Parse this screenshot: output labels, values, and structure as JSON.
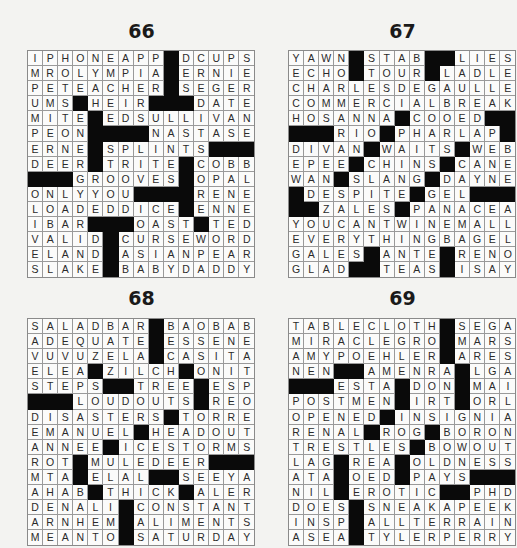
{
  "puzzles": [
    {
      "number": "66",
      "rows": [
        "IPHONEAPP#DCUPS",
        "MROLYMPIA#ERNIE",
        "PETEACHER#SEGER",
        "UMS#HEIR###DATE",
        "MITE#EDSULLIVAN",
        "PEON####NASTASE",
        "ERNE#SPLINTS###",
        "DEER#TRITE#COBB",
        "###GROOVES#OPAL",
        "ONLYYOU####RENE",
        "LOADEDDICE#ENNE",
        "IBAR###OAST#TED",
        "VALID#CURSEWORD",
        "ELAND#ASIANPEAR",
        "SLAKE#BABYDADDY"
      ]
    },
    {
      "number": "67",
      "rows": [
        "YAWN#STAB##LIES",
        "ECHO#TOUR#LADLE",
        "CHARLESDEGAULLE",
        "COMMERCIALBREAK",
        "HOSANNA#COOED##",
        "###RIO#PHARLAP#",
        "DIVAN#WAITS#WEB",
        "EPEE#CHINS#CANE",
        "WAN#SLANG#DAYNE",
        "#DESPITE#GEL###",
        "##ZALES#PANACEA",
        "YOUCANTWINEMALL",
        "EVERYTHINGBAGEL",
        "GALES#ANTE#RENO",
        "GLAD##TEAS#ISAY"
      ]
    },
    {
      "number": "68",
      "rows": [
        "SALADBAR#BAOBAB",
        "ADEQUATE#ESSENE",
        "VUVUZELA#CASITA",
        "ELEA#ZILCH#ONIT",
        "STEPS##TREE#ESP",
        "###LOUDOUTS#REO",
        "DISASTERS#TORRE",
        "EMANUEL#HEADOUT",
        "ANNEE#ICESTORMS",
        "ROT#MULEDEER###",
        "MTA#ELAL##SEEYA",
        "AHAB#THICK#ALER",
        "DENALI#CONSTANT",
        "ARNHEM#ALIMENTS",
        "MEANTO#SATURDAY"
      ]
    },
    {
      "number": "69",
      "rows": [
        "TABLECLOTH#SEGA",
        "MIRACLEGRO#MARS",
        "AMYPOEHLER#ARES",
        "NEN##AMENRA#LGA",
        "###ESTA#DON#MAI",
        "POSTMEN#IRT#ORL",
        "OPENED#INSIGNIA",
        "RENAL#ROG#BORON",
        "TRESTLES#BOWOUT",
        "LAG#REA#OLDNESS",
        "ATA#OED#PAYS###",
        "NIL#EROTIC##PHD",
        "DOES#SNEAKAPEEK",
        "INSP#ALLTERRAIN",
        "ASEA#TYLERPERRY"
      ]
    }
  ],
  "colors": {
    "page": "#f3f3f1",
    "cell": "#fbfbfa",
    "block": "#0a0a0a",
    "text": "#2a2a2a"
  }
}
